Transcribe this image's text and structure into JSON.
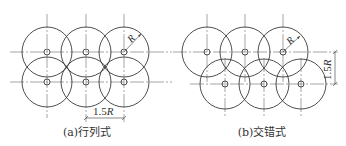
{
  "diagrams": [
    {
      "id": "a",
      "caption": "(a)行列式",
      "radius_label": "R",
      "spacing_label": "1.5R",
      "layout": "grid",
      "rows": 2,
      "cols": 3
    },
    {
      "id": "b",
      "caption": "(b)交错式",
      "radius_label": "R",
      "spacing_label": "1.5R",
      "layout": "staggered",
      "rows": 2,
      "cols": 3
    }
  ],
  "colors": {
    "line": "#3a3a3a",
    "axis": "#6a6a6a",
    "background": "#ffffff"
  }
}
